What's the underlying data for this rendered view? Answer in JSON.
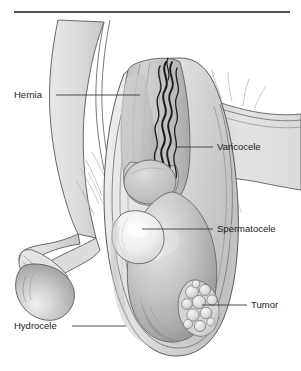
{
  "figure": {
    "type": "medical-line-illustration",
    "colors": {
      "background": "#ffffff",
      "outline": "#555555",
      "rule": "#1a1a1a",
      "skin_light": "#e2e2e2",
      "skin_mid": "#cfcfcf",
      "skin_shadow": "#b0b0b0",
      "testis_base": "#c3c3c3",
      "testis_shadow": "#8e8e8e",
      "cyst_light": "#f2f2f2",
      "tumor_fill": "#d8d8d8",
      "vein_dark": "#1d1d1d",
      "label_text": "#1c1c1c",
      "leader_line": "#3a3a3a"
    },
    "top_rule": {
      "present": true,
      "x1": 14,
      "x2": 290,
      "y": 12
    }
  },
  "labels": [
    {
      "id": "hernia",
      "text": "Hernia",
      "text_x": 14,
      "text_y": 98,
      "anchor": "start",
      "leader": {
        "x1": 56,
        "y1": 95,
        "x2": 140,
        "y2": 95
      },
      "side": "left",
      "target": "inguinal-hernia-bulge"
    },
    {
      "id": "varicocele",
      "text": "Varicocele",
      "text_x": 217,
      "text_y": 150,
      "anchor": "start",
      "leader": {
        "x1": 176,
        "y1": 147,
        "x2": 213,
        "y2": 147
      },
      "side": "right",
      "target": "dilated-pampiniform-veins"
    },
    {
      "id": "spermatocele",
      "text": "Spermatocele",
      "text_x": 217,
      "text_y": 232,
      "anchor": "start",
      "leader": {
        "x1": 142,
        "y1": 229,
        "x2": 213,
        "y2": 229
      },
      "side": "right",
      "target": "epididymal-cyst"
    },
    {
      "id": "tumor",
      "text": "Tumor",
      "text_x": 251,
      "text_y": 308,
      "anchor": "start",
      "leader": {
        "x1": 202,
        "y1": 305,
        "x2": 247,
        "y2": 305
      },
      "side": "right",
      "target": "testicular-tumor-nodules"
    },
    {
      "id": "hydrocele",
      "text": "Hydrocele",
      "text_x": 14,
      "text_y": 329,
      "anchor": "start",
      "leader": {
        "x1": 72,
        "y1": 326,
        "x2": 126,
        "y2": 326
      },
      "side": "left",
      "target": "tunica-vaginalis-fluid"
    }
  ],
  "structures": [
    {
      "id": "abdominal-wall",
      "name": "Abdominal wall / groin"
    },
    {
      "id": "penis-shaft",
      "name": "Penis shaft"
    },
    {
      "id": "glans-penis",
      "name": "Glans penis"
    },
    {
      "id": "foreskin",
      "name": "Foreskin fold"
    },
    {
      "id": "thigh",
      "name": "Upper thigh"
    },
    {
      "id": "scrotal-sac",
      "name": "Scrotal sac"
    },
    {
      "id": "spermatic-cord",
      "name": "Spermatic cord"
    },
    {
      "id": "inguinal-hernia-bulge",
      "name": "Hernia bulge in cord"
    },
    {
      "id": "dilated-pampiniform-veins",
      "name": "Dilated pampiniform plexus veins"
    },
    {
      "id": "epididymis",
      "name": "Epididymis head"
    },
    {
      "id": "epididymal-cyst",
      "name": "Spermatocele cyst"
    },
    {
      "id": "testis",
      "name": "Testis"
    },
    {
      "id": "testicular-tumor-nodules",
      "name": "Lobulated tumor mass"
    },
    {
      "id": "tunica-vaginalis-fluid",
      "name": "Hydrocele fluid layer"
    }
  ]
}
